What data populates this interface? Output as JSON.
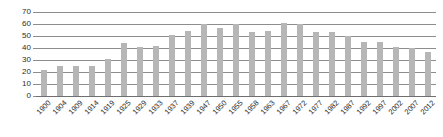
{
  "chart_data": {
    "type": "bar",
    "title": "",
    "subtitle": "",
    "xlabel": "",
    "ylabel": "",
    "ylim": [
      0,
      70
    ],
    "xlim": null,
    "grid": true,
    "legend": false,
    "legend_position": "none",
    "bar_color": "#b6b6b6",
    "gridline_color": "#8d8d8d",
    "axis_text_color": "#2b2b2b",
    "y_ticks": [
      0,
      10,
      20,
      30,
      40,
      50,
      60,
      70
    ],
    "y_tick_labels": [
      "0",
      "10",
      "20",
      "30",
      "40",
      "50",
      "60",
      "70"
    ],
    "categories": [
      "1900",
      "1904",
      "1909",
      "1914",
      "1919",
      "1925",
      "1929",
      "1933",
      "1937",
      "1939",
      "1947",
      "1950",
      "1955",
      "1958",
      "1963",
      "1967",
      "1972",
      "1977",
      "1982",
      "1987",
      "1992",
      "1997",
      "2002",
      "2007",
      "2012"
    ],
    "values": [
      22,
      25,
      25,
      25,
      31,
      44,
      41,
      42,
      51,
      54,
      60,
      57,
      60,
      53,
      54,
      61,
      60,
      53,
      53,
      50,
      45,
      45,
      41,
      40,
      37
    ],
    "annotations": []
  }
}
